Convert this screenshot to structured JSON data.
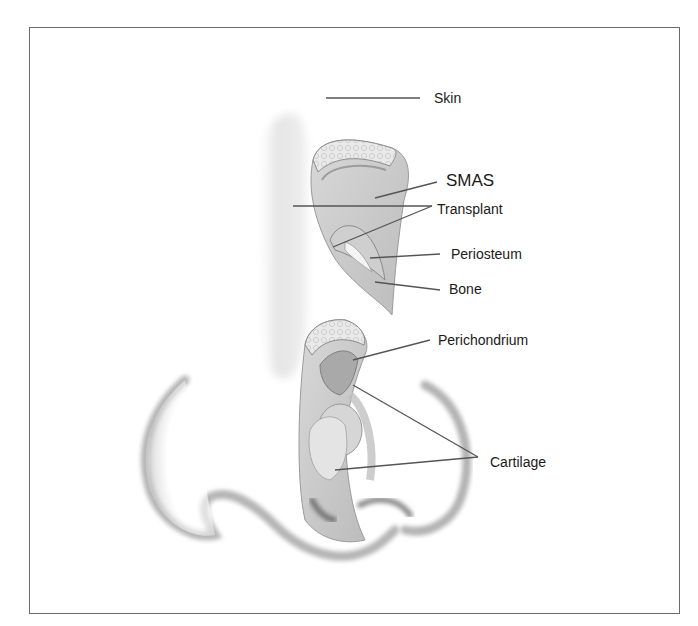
{
  "diagram": {
    "type": "anatomical-illustration",
    "colors": {
      "border": "#6a6a6a",
      "leader_line": "#555555",
      "skin_shade": "#e6e6e6",
      "tissue_light": "#d9d9d9",
      "tissue_mid": "#bdbdbd",
      "tissue_dark": "#9a9a9a",
      "text": "#1a1a1a"
    },
    "labels": [
      {
        "id": "skin",
        "text": "Skin",
        "x": 434,
        "y": 91,
        "big": false
      },
      {
        "id": "smas",
        "text": "SMAS",
        "x": 446,
        "y": 172,
        "big": true
      },
      {
        "id": "transplant",
        "text": "Transplant",
        "x": 437,
        "y": 202,
        "big": false
      },
      {
        "id": "periosteum",
        "text": "Periosteum",
        "x": 451,
        "y": 247,
        "big": false
      },
      {
        "id": "bone",
        "text": "Bone",
        "x": 449,
        "y": 282,
        "big": false
      },
      {
        "id": "perichondrium",
        "text": "Perichondrium",
        "x": 438,
        "y": 333,
        "big": false
      },
      {
        "id": "cartilage",
        "text": "Cartilage",
        "x": 490,
        "y": 455,
        "big": false
      }
    ],
    "leader_lines": [
      {
        "label": "skin",
        "x1": 326,
        "y1": 98,
        "x2": 420,
        "y2": 98
      },
      {
        "label": "smas",
        "x1": 375,
        "y1": 198,
        "x2": 437,
        "y2": 182
      },
      {
        "label": "transplant",
        "x1": 293,
        "y1": 206,
        "x2": 432,
        "y2": 206
      },
      {
        "label": "transplant",
        "x1": 333,
        "y1": 247,
        "x2": 432,
        "y2": 206
      },
      {
        "label": "periosteum",
        "x1": 370,
        "y1": 258,
        "x2": 440,
        "y2": 254
      },
      {
        "label": "bone",
        "x1": 375,
        "y1": 282,
        "x2": 440,
        "y2": 290
      },
      {
        "label": "perichondrium",
        "x1": 353,
        "y1": 360,
        "x2": 430,
        "y2": 340
      },
      {
        "label": "cartilage",
        "x1": 353,
        "y1": 385,
        "x2": 478,
        "y2": 457
      },
      {
        "label": "cartilage",
        "x1": 335,
        "y1": 470,
        "x2": 478,
        "y2": 457
      }
    ]
  }
}
